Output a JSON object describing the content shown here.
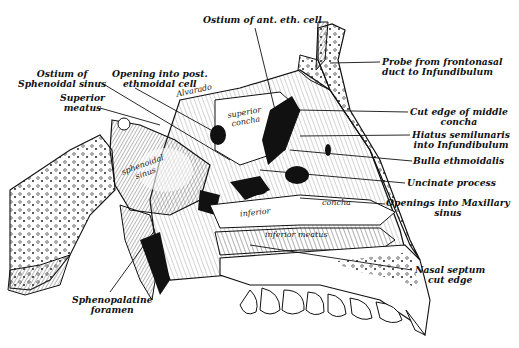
{
  "figure": {
    "labels_left": {
      "ostium_sphenoidal": [
        "Ostium of",
        "Sphenoidal sinus"
      ],
      "opening_post_eth": [
        "Opening into post.",
        "ethmoidal cell"
      ],
      "superior_meatus": [
        "Superior",
        "meatus"
      ],
      "sphenopalatine": [
        "Sphenopalatine",
        "foramen"
      ]
    },
    "labels_top": {
      "ostium_ant_eth": "Ostium of ant. eth. cell"
    },
    "labels_right": {
      "probe": [
        "Probe from frontonasal",
        "duct to Infundibulum"
      ],
      "cut_edge_middle": [
        "Cut edge of middle",
        "concha"
      ],
      "hiatus": [
        "Hiatus semilunaris",
        "into Infundibulum"
      ],
      "bulla": "Bulla ethmoidalis",
      "uncinate": "Uncinate process",
      "openings_maxillary": [
        "Openings into Maxillary",
        "sinus"
      ],
      "nasal_septum": [
        "Nasal septum",
        "cut edge"
      ]
    },
    "inner_labels": {
      "superior_concha": [
        "superior",
        "concha"
      ],
      "sphenoidal_sinus": [
        "sphenoidal",
        "sinus"
      ],
      "inferior_concha_a": "inferior",
      "inferior_concha_b": "concha",
      "inferior_meatus": "inferior meatus",
      "signature": "Alvarado"
    },
    "colors": {
      "ink": "#111111",
      "background": "#ffffff"
    }
  }
}
